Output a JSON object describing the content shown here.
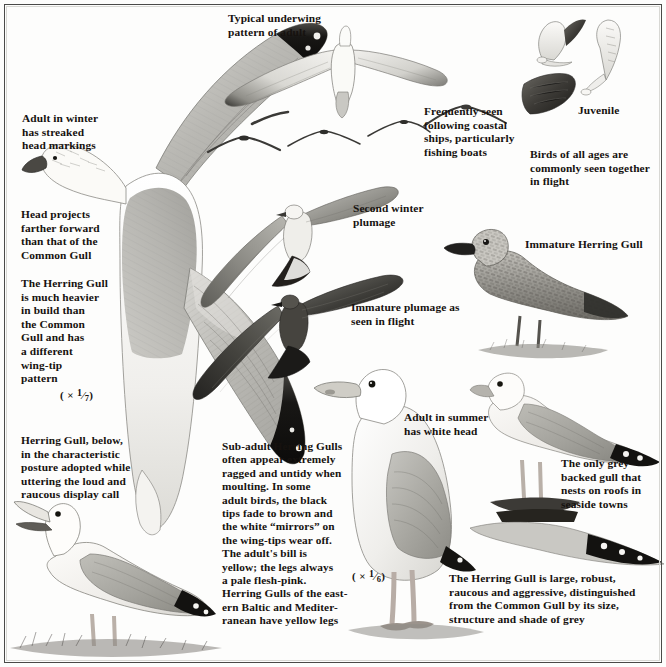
{
  "plate": {
    "title": "Herring Gull identification plate",
    "frame_color": "#4a4a48",
    "background_color": "#fdfdfc",
    "ink_color": "#16120f"
  },
  "captions": {
    "adult_winter_head": "Adult in winter\nhas streaked\nhead markings",
    "head_projects": "Head projects\nfarther forward\nthan that of the\nCommon Gull",
    "heavier_build": "The Herring Gull\nis much heavier\nin build than\nthe Common\nGull and has\na different\nwing-tip\npattern",
    "display_call": "Herring Gull, below,\nin the characteristic\nposture adopted while\nuttering the loud and\nraucous display call",
    "typical_underwing": "Typical underwing\npattern of adult",
    "following_ships": "Frequently seen\nfollowing coastal\nships, particularly\nfishing boats",
    "juvenile": "Juvenile",
    "all_ages": "Birds of all ages are\ncommonly seen together\nin flight",
    "second_winter": "Second winter\nplumage",
    "immature_in_flight": "Immature plumage as\nseen in flight",
    "immature_herring_gull": "Immature Herring Gull",
    "sub_adult_block": "Sub-adult Herring Gulls\noften appear extremely\nragged and untidy when\nmoulting. In some\nadult birds, the black\ntips fade to brown and\nthe white “mirrors” on\nthe wing-tips wear off.\nThe adult's bill is\nyellow; the legs always\na pale flesh-pink.\nHerring Gulls of the east-\nern Baltic and Mediter-\nranean have yellow legs",
    "adult_summer": "Adult in summer\nhas white head",
    "roof_nesting": "The only grey-\nbacked gull that\nnests on roofs in\nseaside towns",
    "summary": "The Herring Gull is large, robust,\nraucous and aggressive, distinguished\nfrom the Common Gull by its size,\nstructure and shade of grey"
  },
  "scales": {
    "left": {
      "prefix": "( × ",
      "numerator": "1",
      "denominator": "7",
      "suffix": ")"
    },
    "center": {
      "prefix": "( × ",
      "numerator": "1",
      "denominator": "6",
      "suffix": ")"
    }
  },
  "figures": [
    {
      "name": "adult-in-flight-from-above",
      "note": "large adult Herring Gull seen from above, wings spread, black wing-tips with white mirrors"
    },
    {
      "name": "adult-underwing-in-flight",
      "note": "adult gliding, pale underwing, dark outer primaries"
    },
    {
      "name": "distant-gull-silhouettes",
      "note": "four small distant gulls in flight"
    },
    {
      "name": "juvenile-in-flight-pair",
      "note": "three juvenile/immature gulls in flight, dark mottled plumage"
    },
    {
      "name": "second-winter-gull-in-flight",
      "note": "second winter plumage bird in flight"
    },
    {
      "name": "immature-gull-in-flight",
      "note": "dark immature bird in flight seen from above"
    },
    {
      "name": "immature-gull-standing",
      "note": "immature Herring Gull standing, heavily streaked brown plumage"
    },
    {
      "name": "adult-summer-standing",
      "note": "adult in summer standing, white head, grey back, black wing-tips"
    },
    {
      "name": "adult-on-roof",
      "note": "adult standing on a roof ridge"
    },
    {
      "name": "calling-gull",
      "note": "Herring Gull in display posture, bill open, calling"
    }
  ]
}
